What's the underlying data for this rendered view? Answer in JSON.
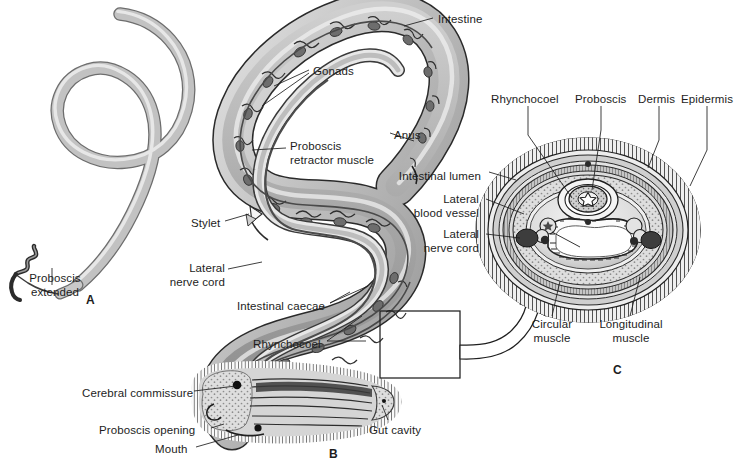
{
  "figure": {
    "width": 741,
    "height": 464,
    "background": "#ffffff",
    "ink": "#1d1d1d"
  },
  "palette": {
    "outline": "#1d1d1d",
    "body_light": "#d8d8d8",
    "body_mid": "#b0b0b0",
    "body_dark": "#7d7d7d",
    "body_darker": "#555555",
    "highlight": "#f2f2f2",
    "stipple": "#9a9a9a",
    "nerve_cord_fill": "#4a4a4a"
  },
  "panels": [
    {
      "id": "A",
      "letter": "A",
      "x": 86,
      "y": 293,
      "caption": "Whole worm with proboscis extended"
    },
    {
      "id": "B",
      "letter": "B",
      "x": 329,
      "y": 447,
      "caption": "Longitudinal section of body"
    },
    {
      "id": "C",
      "letter": "C",
      "x": 613,
      "y": 363,
      "caption": "Cross section of body"
    }
  ],
  "labels": [
    {
      "name": "proboscis-extended",
      "text": "Proboscis\nextended",
      "x": 13,
      "y": 272,
      "align": "left",
      "panel": "A"
    },
    {
      "name": "intestine",
      "text": "Intestine",
      "x": 438,
      "y": 13,
      "align": "left",
      "panel": "B"
    },
    {
      "name": "gonads",
      "text": "Gonads",
      "x": 313,
      "y": 65,
      "align": "left",
      "panel": "B"
    },
    {
      "name": "proboscis-retractor-muscle",
      "text": "Proboscis\nretractor muscle",
      "x": 290,
      "y": 140,
      "align": "left",
      "panel": "B"
    },
    {
      "name": "anus",
      "text": "Anus",
      "x": 394,
      "y": 129,
      "align": "left",
      "panel": "B"
    },
    {
      "name": "stylet",
      "text": "Stylet",
      "x": 191,
      "y": 217,
      "align": "left",
      "panel": "B"
    },
    {
      "name": "lateral-nerve-cord-b",
      "text": "Lateral\nnerve cord",
      "x": 175,
      "y": 262,
      "align": "left",
      "panel": "B"
    },
    {
      "name": "intestinal-caecae",
      "text": "Intestinal caecae",
      "x": 237,
      "y": 300,
      "align": "left",
      "panel": "B"
    },
    {
      "name": "rhynchocoel-b",
      "text": "Rhynchocoel",
      "x": 253,
      "y": 338,
      "align": "left",
      "panel": "B"
    },
    {
      "name": "cerebral-commissure",
      "text": "Cerebral commissure",
      "x": 82,
      "y": 387,
      "align": "left",
      "panel": "B"
    },
    {
      "name": "proboscis-opening",
      "text": "Proboscis opening",
      "x": 99,
      "y": 424,
      "align": "left",
      "panel": "B"
    },
    {
      "name": "mouth",
      "text": "Mouth",
      "x": 155,
      "y": 443,
      "align": "left",
      "panel": "B"
    },
    {
      "name": "gut-cavity",
      "text": "Gut cavity",
      "x": 369,
      "y": 424,
      "align": "left",
      "panel": "B"
    },
    {
      "name": "rhynchocoel-c",
      "text": "Rhynchocoel",
      "x": 491,
      "y": 93,
      "align": "left",
      "panel": "C"
    },
    {
      "name": "proboscis-c",
      "text": "Proboscis",
      "x": 575,
      "y": 93,
      "align": "left",
      "panel": "C"
    },
    {
      "name": "dermis",
      "text": "Dermis",
      "x": 638,
      "y": 93,
      "align": "left",
      "panel": "C"
    },
    {
      "name": "epidermis",
      "text": "Epidermis",
      "x": 681,
      "y": 93,
      "align": "left",
      "panel": "C"
    },
    {
      "name": "intestinal-lumen",
      "text": "Intestinal lumen",
      "x": 392,
      "y": 170,
      "align": "left",
      "panel": "C"
    },
    {
      "name": "lateral-blood-vessel",
      "text": "Lateral\nblood vessel",
      "x": 392,
      "y": 193,
      "align": "left",
      "panel": "C"
    },
    {
      "name": "lateral-nerve-cord-c",
      "text": "Lateral\nnerve cord",
      "x": 392,
      "y": 228,
      "align": "left",
      "panel": "C"
    },
    {
      "name": "circular-muscle",
      "text": "Circular\nmuscle",
      "x": 529,
      "y": 318,
      "align": "left",
      "panel": "C"
    },
    {
      "name": "longitudinal-muscle",
      "text": "Longitudinal\nmuscle",
      "x": 601,
      "y": 318,
      "align": "left",
      "panel": "C"
    }
  ],
  "structures": {
    "A": [
      "body",
      "proboscis-extended-tip"
    ],
    "B": [
      "body-wall",
      "epidermis",
      "intestine",
      "intestinal-caecae",
      "gonads",
      "rhynchocoel",
      "proboscis",
      "proboscis-retractor-muscle",
      "stylet",
      "lateral-nerve-cord",
      "cerebral-commissure",
      "mouth",
      "proboscis-opening",
      "gut-cavity",
      "anus",
      "inset-box"
    ],
    "C": [
      "epidermis",
      "dermis",
      "circular-muscle",
      "longitudinal-muscle",
      "rhynchocoel",
      "proboscis",
      "intestinal-lumen",
      "lateral-blood-vessel",
      "lateral-nerve-cord",
      "stylet-star"
    ]
  }
}
